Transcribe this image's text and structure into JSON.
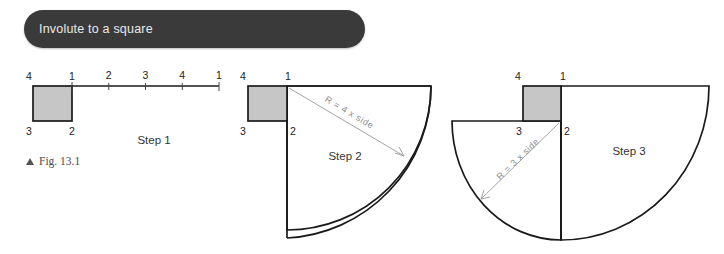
{
  "header": {
    "title": "Involute to a square",
    "background_color": "#3a3a3a",
    "text_color": "#e9e9e9"
  },
  "figure": {
    "caption": "Fig. 13.1",
    "marker_icon": "triangle-up-icon"
  },
  "colors": {
    "square_fill": "#c6c6c6",
    "outline": "#1a1a1a",
    "radius_line": "#9a9a9a",
    "background": "#ffffff"
  },
  "steps": [
    {
      "id": "step-1",
      "label": "Step 1",
      "vertex_labels": {
        "top_left": "4",
        "top_right": "1",
        "bottom_left": "3",
        "bottom_right": "2"
      },
      "rectified_line": {
        "tick_labels": [
          "1",
          "2",
          "3",
          "4",
          "1"
        ],
        "segments": 4
      }
    },
    {
      "id": "step-2",
      "label": "Step 2",
      "vertex_labels": {
        "top_left": "4",
        "top_right": "1",
        "bottom_left": "3",
        "bottom_right": "2"
      },
      "radius_label": "R = 4 x side",
      "radius_multiplier": 4
    },
    {
      "id": "step-3",
      "label": "Step 3",
      "vertex_labels": {
        "top_left": "4",
        "top_right": "1",
        "bottom_left": "3",
        "bottom_right": "2"
      },
      "radius_label": "R = 3 x side",
      "radius_multiplier": 3
    }
  ]
}
